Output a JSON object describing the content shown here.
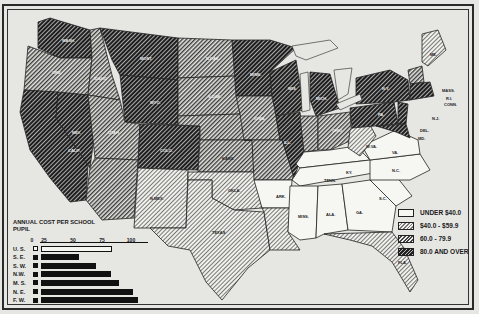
{
  "legend": {
    "items": [
      {
        "label": "UNDER $40.0",
        "class": "under-40"
      },
      {
        "label": "$40.0 - $59.9",
        "class": "40-59"
      },
      {
        "label": "60.0 -  79.9",
        "class": "60-79"
      },
      {
        "label": "80.0 AND OVER",
        "class": "80-plus"
      }
    ]
  },
  "bar_chart": {
    "title": "ANNUAL COST PER SCHOOL PUPIL",
    "axis_ticks": [
      "0",
      "25",
      "50",
      "75",
      "100"
    ],
    "rows": [
      {
        "label": "U. S.",
        "value": 71,
        "style": "open"
      },
      {
        "label": "S. E.",
        "value": 38,
        "style": "solid"
      },
      {
        "label": "S. W.",
        "value": 55,
        "style": "solid"
      },
      {
        "label": "N.W.",
        "value": 70,
        "style": "solid"
      },
      {
        "label": "M. S.",
        "value": 78,
        "style": "solid"
      },
      {
        "label": "N. E.",
        "value": 92,
        "style": "solid"
      },
      {
        "label": "F. W.",
        "value": 97,
        "style": "solid"
      }
    ]
  },
  "state_labels": {
    "ky": "KY.",
    "tenn": "TENN.",
    "ark": "ARK.",
    "miss": "MISS.",
    "ala": "ALA.",
    "ga": "GA.",
    "sc": "S.C.",
    "nc": "N.C.",
    "va": "VA.",
    "wva": "W.VA.",
    "fla": "FLA.",
    "texas": "TEXAS",
    "okla": "OKLA.",
    "nmex": "N.MEX.",
    "kans": "KANS.",
    "mass": "MASS.",
    "ri": "R.I.",
    "conn": "CONN.",
    "nj": "N.J.",
    "del": "DEL.",
    "md": "MD.",
    "me": "ME.",
    "ny": "N.Y.",
    "pa": "PA.",
    "ohio": "OHIO",
    "ill": "ILL.",
    "mich": "MICH.",
    "wis": "WIS.",
    "minn": "MINN.",
    "iowa": "IOWA",
    "mo": "MO.",
    "calif": "CALIF.",
    "nev": "NEV.",
    "ore": "ORE.",
    "wash": "WASH.",
    "idaho": "IDAHO",
    "mont": "MONT.",
    "wyo": "WYO.",
    "utah": "UTAH",
    "colo": "COLO.",
    "ariz": "ARIZ.",
    "ndak": "N.DAK.",
    "sdak": "S.DAK.",
    "nebr": "NEBR.",
    "ind": "IND."
  },
  "chart_data": {
    "type": "bar",
    "title": "ANNUAL COST PER SCHOOL PUPIL",
    "orientation": "horizontal",
    "categories": [
      "U. S.",
      "S. E.",
      "S. W.",
      "N.W.",
      "M. S.",
      "N. E.",
      "F. W."
    ],
    "values": [
      71,
      38,
      55,
      70,
      78,
      92,
      97
    ],
    "xlabel": "",
    "ylabel": "",
    "xlim": [
      0,
      100
    ],
    "xticks": [
      0,
      25,
      50,
      75,
      100
    ],
    "map_legend": [
      "UNDER $40.0",
      "$40.0 - $59.9",
      "60.0 - 79.9",
      "80.0 AND OVER"
    ],
    "map_classes": {
      "UNDER $40.0": [
        "KY.",
        "TENN.",
        "ARK.",
        "MISS.",
        "ALA.",
        "GA.",
        "S.C.",
        "N.C.",
        "VA."
      ],
      "$40.0 - $59.9": [
        "N.MEX.",
        "OKLA.",
        "TEXAS",
        "FLA.",
        "W.VA.",
        "ME.",
        "LA."
      ],
      "60.0 - 79.9": [
        "ORE.",
        "IDAHO",
        "UTAH",
        "ARIZ.",
        "N.DAK.",
        "S.DAK.",
        "NEBR.",
        "KANS.",
        "IOWA",
        "MO.",
        "IND.",
        "OHIO",
        "VT.",
        "N.H."
      ],
      "80.0 AND OVER": [
        "WASH.",
        "CALIF.",
        "NEV.",
        "MONT.",
        "WYO.",
        "COLO.",
        "MINN.",
        "WIS.",
        "ILL.",
        "MICH.",
        "N.Y.",
        "PA.",
        "N.J.",
        "MASS.",
        "R.I.",
        "CONN.",
        "DEL.",
        "MD."
      ]
    }
  }
}
